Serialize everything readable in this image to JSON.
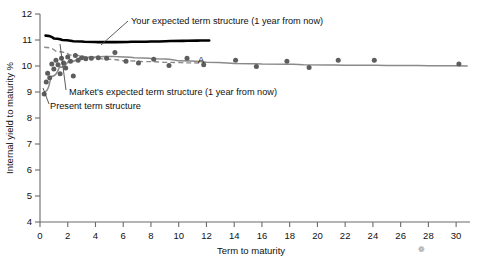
{
  "chart_data": {
    "type": "line",
    "title": "",
    "xlabel": "Term to maturity",
    "ylabel": "Internal yield to maturity %",
    "xlim": [
      0,
      31
    ],
    "ylim": [
      4,
      12
    ],
    "grid": false,
    "legend": "inline-annotations",
    "xticks": [
      0,
      2,
      4,
      6,
      8,
      10,
      12,
      14,
      16,
      18,
      20,
      22,
      24,
      26,
      28,
      30
    ],
    "xticklabels": [
      "0",
      "2",
      "4",
      "6",
      "8",
      "10",
      "12",
      "14",
      "16",
      "18",
      "20",
      "22",
      "24",
      "26",
      "28",
      "30"
    ],
    "yticks": [
      4,
      5,
      6,
      7,
      8,
      9,
      10,
      11,
      12
    ],
    "yticklabels": [
      "4",
      "5",
      "6",
      "7",
      "8",
      "9",
      "10",
      "11",
      "12"
    ],
    "series": [
      {
        "name": "Your expected term structure (1 year from now)",
        "style": "thick-black-solid",
        "color": "#000000",
        "x": [
          0.4,
          1.0,
          1.6,
          2.4,
          3.2,
          4.2,
          5.4,
          6.6,
          8.0,
          9.4,
          10.6,
          11.6,
          12.2
        ],
        "y": [
          11.17,
          11.06,
          11.0,
          10.95,
          10.93,
          10.92,
          10.92,
          10.93,
          10.94,
          10.96,
          10.97,
          10.98,
          10.98
        ]
      },
      {
        "name": "Market's expected term structure (1 year from now)",
        "style": "gray-solid",
        "color": "#8a8a8a",
        "x": [
          0.3,
          0.8,
          1.4,
          2.0,
          2.8,
          3.6,
          4.6,
          5.6,
          6.8,
          8.2,
          10.0,
          12.0,
          14.0,
          16.0,
          19.0,
          22.0,
          25.0,
          28.0,
          30.8
        ],
        "y": [
          9.0,
          9.6,
          9.95,
          10.15,
          10.3,
          10.35,
          10.37,
          10.36,
          10.32,
          10.28,
          10.2,
          10.14,
          10.1,
          10.08,
          10.05,
          10.03,
          10.02,
          10.01,
          10.0
        ]
      },
      {
        "name": "Present term structure",
        "style": "gray-dashed",
        "color": "#8a8a8a",
        "x": [
          0.3,
          1.2,
          2.2,
          3.4,
          4.6,
          6.0,
          7.4,
          9.0,
          10.6,
          11.8
        ],
        "y": [
          10.72,
          10.55,
          10.42,
          10.33,
          10.26,
          10.2,
          10.17,
          10.14,
          10.12,
          10.11
        ]
      }
    ],
    "scatter": {
      "name": "observed bond yields",
      "color": "#5d5d5d",
      "marker": "circle",
      "points": [
        [
          0.3,
          8.92
        ],
        [
          0.45,
          9.38
        ],
        [
          0.55,
          9.72
        ],
        [
          0.7,
          9.55
        ],
        [
          0.85,
          10.08
        ],
        [
          1.0,
          9.88
        ],
        [
          1.15,
          10.22
        ],
        [
          1.3,
          10.05
        ],
        [
          1.45,
          9.7
        ],
        [
          1.55,
          10.3
        ],
        [
          1.7,
          10.12
        ],
        [
          1.85,
          9.92
        ],
        [
          2.0,
          10.35
        ],
        [
          2.2,
          10.18
        ],
        [
          2.4,
          9.62
        ],
        [
          2.55,
          10.4
        ],
        [
          2.75,
          10.22
        ],
        [
          3.0,
          10.32
        ],
        [
          3.3,
          10.28
        ],
        [
          3.7,
          10.3
        ],
        [
          4.2,
          10.32
        ],
        [
          4.8,
          10.3
        ],
        [
          5.4,
          10.52
        ],
        [
          6.2,
          10.18
        ],
        [
          7.1,
          10.12
        ],
        [
          8.2,
          10.26
        ],
        [
          9.3,
          10.02
        ],
        [
          10.6,
          10.3
        ],
        [
          11.8,
          10.05
        ],
        [
          14.1,
          10.22
        ],
        [
          15.6,
          9.98
        ],
        [
          17.8,
          10.18
        ],
        [
          19.4,
          9.94
        ],
        [
          21.5,
          10.22
        ],
        [
          24.1,
          10.22
        ],
        [
          30.2,
          10.08
        ]
      ]
    },
    "annotations": [
      {
        "id": "your-expected",
        "text": "Your expected term structure (1 year from now)",
        "text_x_px": 131,
        "text_y_px": 24,
        "leader": [
          [
            128,
            21
          ],
          [
            101,
            45
          ]
        ]
      },
      {
        "id": "markets-expected",
        "text": "Market's expected term structure (1 year from now)",
        "text_x_px": 69,
        "text_y_px": 95,
        "leader": [
          [
            66,
            90
          ],
          [
            60,
            44
          ]
        ]
      },
      {
        "id": "present",
        "text": "Present term structure",
        "text_x_px": 50,
        "text_y_px": 109,
        "leader": [
          [
            49,
            104
          ],
          [
            43,
            88
          ]
        ]
      },
      {
        "id": "point-a",
        "text": "A",
        "text_x_px": 198,
        "text_y_px": 63,
        "leader": null
      }
    ],
    "stray_mark": "❁"
  }
}
